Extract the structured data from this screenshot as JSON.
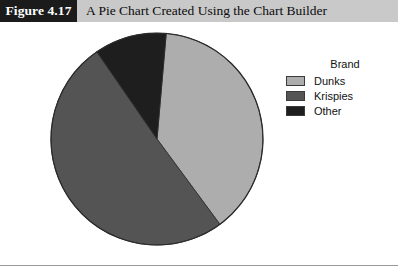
{
  "figure": {
    "number_label": "Figure 4.17",
    "title": "A Pie Chart Created Using the Chart Builder"
  },
  "legend": {
    "title": "Brand",
    "entries": [
      {
        "label": "Dunks",
        "color": "#adadad"
      },
      {
        "label": "Krispies",
        "color": "#545454"
      },
      {
        "label": "Other",
        "color": "#1e1e1e"
      }
    ]
  },
  "chart_data": {
    "type": "pie",
    "title": "A Pie Chart Created Using the Chart Builder",
    "legend_title": "Brand",
    "legend_position": "right",
    "categories": [
      "Dunks",
      "Krispies",
      "Other"
    ],
    "values": [
      38.5,
      50.5,
      11.0
    ],
    "value_unit": "percent",
    "colors": [
      "#adadad",
      "#545454",
      "#1e1e1e"
    ],
    "start_angle_deg": 5,
    "direction": "clockwise",
    "labels_shown": false,
    "grid": false,
    "center_px": [
      157,
      139
    ],
    "radius_px": 106
  },
  "colors": {
    "figure_number_background": "#1b1b1b",
    "figure_number_text": "#ffffff",
    "title_band_background": "#c9c9c9",
    "title_text": "#0c0c0c",
    "page_background": "#ffffff",
    "pie_outline": "#2b2b2b",
    "rule": "#9a9a9a"
  }
}
